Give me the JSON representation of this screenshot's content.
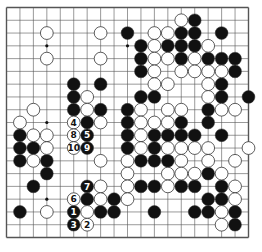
{
  "board": {
    "size": 19,
    "colors": {
      "line": "#555555",
      "black": "#111111",
      "white": "#ffffff",
      "stone_edge": "#333333",
      "star": "#111111"
    },
    "star_points": [
      [
        3,
        3
      ],
      [
        9,
        3
      ],
      [
        15,
        3
      ],
      [
        3,
        9
      ],
      [
        9,
        9
      ],
      [
        15,
        9
      ],
      [
        3,
        15
      ],
      [
        9,
        15
      ],
      [
        15,
        15
      ]
    ],
    "black": [
      [
        14,
        1
      ],
      [
        9,
        2
      ],
      [
        13,
        2
      ],
      [
        14,
        2
      ],
      [
        16,
        2
      ],
      [
        10,
        3
      ],
      [
        12,
        3
      ],
      [
        13,
        3
      ],
      [
        14,
        3
      ],
      [
        10,
        4
      ],
      [
        13,
        4
      ],
      [
        15,
        4
      ],
      [
        16,
        4
      ],
      [
        17,
        4
      ],
      [
        10,
        5
      ],
      [
        17,
        5
      ],
      [
        5,
        6
      ],
      [
        7,
        6
      ],
      [
        16,
        6
      ],
      [
        5,
        7
      ],
      [
        10,
        7
      ],
      [
        11,
        7
      ],
      [
        16,
        7
      ],
      [
        18,
        7
      ],
      [
        5,
        8
      ],
      [
        7,
        8
      ],
      [
        9,
        8
      ],
      [
        15,
        8
      ],
      [
        6,
        9
      ],
      [
        9,
        9
      ],
      [
        13,
        9
      ],
      [
        15,
        9
      ],
      [
        1,
        10
      ],
      [
        9,
        10
      ],
      [
        11,
        10
      ],
      [
        12,
        10
      ],
      [
        13,
        10
      ],
      [
        14,
        10
      ],
      [
        16,
        10
      ],
      [
        1,
        11
      ],
      [
        2,
        11
      ],
      [
        9,
        11
      ],
      [
        11,
        11
      ],
      [
        1,
        12
      ],
      [
        3,
        12
      ],
      [
        10,
        12
      ],
      [
        11,
        12
      ],
      [
        12,
        12
      ],
      [
        3,
        13
      ],
      [
        15,
        13
      ],
      [
        2,
        14
      ],
      [
        10,
        14
      ],
      [
        11,
        14
      ],
      [
        13,
        14
      ],
      [
        14,
        14
      ],
      [
        16,
        14
      ],
      [
        6,
        15
      ],
      [
        8,
        15
      ],
      [
        15,
        15
      ],
      [
        16,
        15
      ],
      [
        1,
        16
      ],
      [
        7,
        16
      ],
      [
        8,
        16
      ],
      [
        11,
        16
      ],
      [
        14,
        16
      ],
      [
        15,
        16
      ],
      [
        17,
        16
      ],
      [
        17,
        17
      ]
    ],
    "white": [
      [
        13,
        1
      ],
      [
        3,
        2
      ],
      [
        7,
        2
      ],
      [
        11,
        2
      ],
      [
        12,
        2
      ],
      [
        11,
        3
      ],
      [
        15,
        3
      ],
      [
        3,
        4
      ],
      [
        7,
        4
      ],
      [
        11,
        4
      ],
      [
        12,
        4
      ],
      [
        14,
        4
      ],
      [
        11,
        5
      ],
      [
        13,
        5
      ],
      [
        14,
        5
      ],
      [
        15,
        5
      ],
      [
        16,
        5
      ],
      [
        11,
        6
      ],
      [
        12,
        6
      ],
      [
        15,
        6
      ],
      [
        6,
        7
      ],
      [
        15,
        7
      ],
      [
        2,
        8
      ],
      [
        6,
        8
      ],
      [
        10,
        8
      ],
      [
        12,
        8
      ],
      [
        13,
        8
      ],
      [
        16,
        8
      ],
      [
        17,
        8
      ],
      [
        1,
        9
      ],
      [
        7,
        9
      ],
      [
        10,
        9
      ],
      [
        11,
        9
      ],
      [
        12,
        9
      ],
      [
        2,
        10
      ],
      [
        3,
        10
      ],
      [
        10,
        10
      ],
      [
        3,
        11
      ],
      [
        10,
        11
      ],
      [
        12,
        11
      ],
      [
        13,
        11
      ],
      [
        14,
        11
      ],
      [
        15,
        11
      ],
      [
        18,
        11
      ],
      [
        2,
        12
      ],
      [
        7,
        12
      ],
      [
        9,
        12
      ],
      [
        13,
        12
      ],
      [
        15,
        12
      ],
      [
        17,
        12
      ],
      [
        9,
        13
      ],
      [
        12,
        13
      ],
      [
        13,
        13
      ],
      [
        14,
        13
      ],
      [
        16,
        13
      ],
      [
        7,
        14
      ],
      [
        9,
        14
      ],
      [
        12,
        14
      ],
      [
        17,
        14
      ],
      [
        7,
        15
      ],
      [
        9,
        15
      ],
      [
        17,
        15
      ],
      [
        3,
        16
      ],
      [
        6,
        16
      ],
      [
        16,
        16
      ],
      [
        16,
        17
      ]
    ],
    "numbered_moves": [
      {
        "n": "1",
        "color": "black",
        "pos": [
          5,
          16
        ]
      },
      {
        "n": "2",
        "color": "white",
        "pos": [
          6,
          17
        ]
      },
      {
        "n": "3",
        "color": "black",
        "pos": [
          5,
          17
        ]
      },
      {
        "n": "4",
        "color": "white",
        "pos": [
          5,
          9
        ]
      },
      {
        "n": "5",
        "color": "black",
        "pos": [
          6,
          10
        ]
      },
      {
        "n": "6",
        "color": "white",
        "pos": [
          5,
          15
        ]
      },
      {
        "n": "7",
        "color": "black",
        "pos": [
          6,
          14
        ]
      },
      {
        "n": "8",
        "color": "white",
        "pos": [
          5,
          10
        ]
      },
      {
        "n": "9",
        "color": "black",
        "pos": [
          6,
          11
        ]
      },
      {
        "n": "10",
        "color": "white",
        "pos": [
          5,
          11
        ]
      }
    ]
  }
}
